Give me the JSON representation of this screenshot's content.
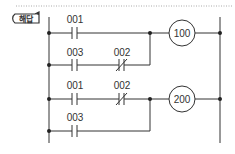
{
  "badge": {
    "label": "해답"
  },
  "diagram": {
    "type": "ladder-logic",
    "rungs": [
      {
        "id": "rung-1",
        "contacts": [
          {
            "label": "001",
            "type": "NO"
          }
        ],
        "coil": "100"
      },
      {
        "id": "rung-2-branch",
        "contacts": [
          {
            "label": "003",
            "type": "NO"
          },
          {
            "label": "002",
            "type": "NC"
          }
        ],
        "parallel_to": "rung-1"
      },
      {
        "id": "rung-3",
        "contacts": [
          {
            "label": "001",
            "type": "NO"
          },
          {
            "label": "002",
            "type": "NC"
          }
        ],
        "coil": "200"
      },
      {
        "id": "rung-4-branch",
        "contacts": [
          {
            "label": "003",
            "type": "NO"
          }
        ],
        "parallel_to": "rung-3"
      }
    ]
  },
  "labels": {
    "r1_c1": "001",
    "r1_coil": "100",
    "r2_c1": "003",
    "r2_c2": "002",
    "r3_c1": "001",
    "r3_c2": "002",
    "r3_coil": "200",
    "r4_c1": "003"
  },
  "colors": {
    "line": "#333333",
    "dots": "#bbbbbb",
    "badge_border": "#333333"
  }
}
